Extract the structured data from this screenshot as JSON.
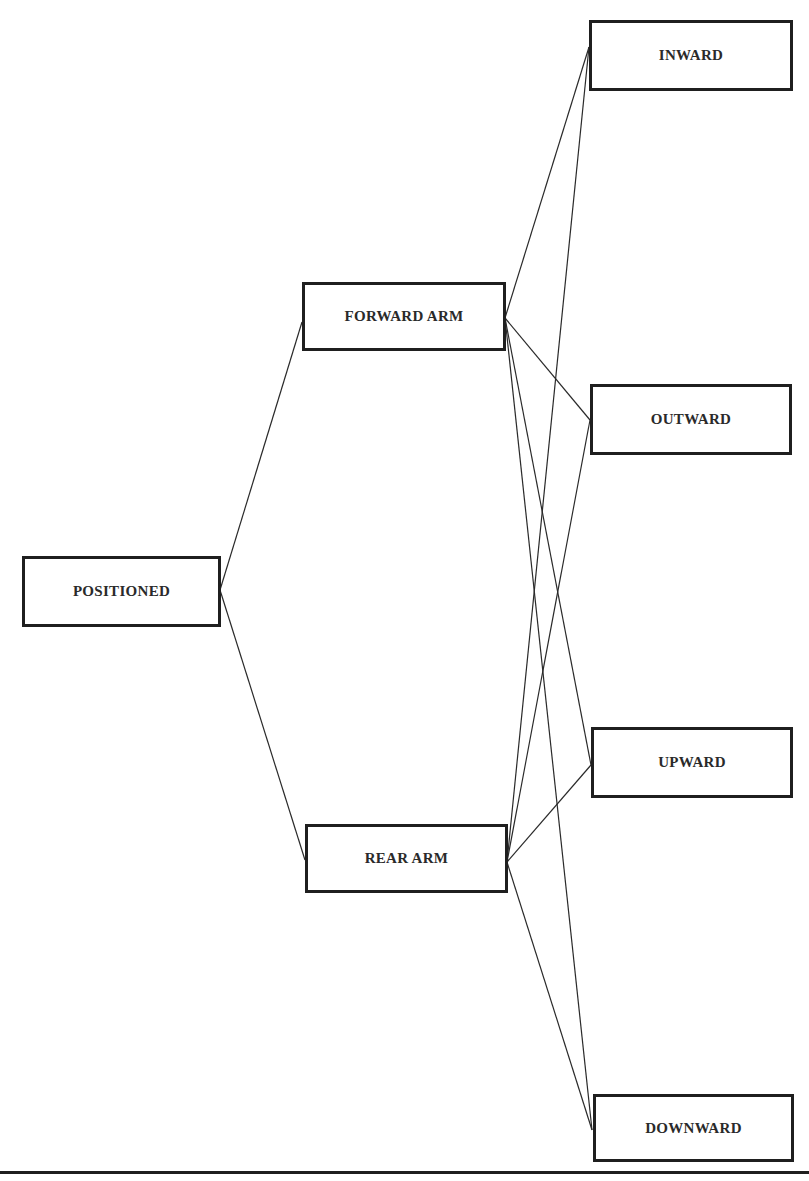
{
  "diagram": {
    "nodes": [
      {
        "id": "positioned",
        "label": "POSITIONED",
        "x": 22,
        "y": 556,
        "w": 199,
        "h": 71
      },
      {
        "id": "forward_arm",
        "label": "FORWARD ARM",
        "x": 302,
        "y": 282,
        "w": 204,
        "h": 69
      },
      {
        "id": "rear_arm",
        "label": "REAR ARM",
        "x": 305,
        "y": 824,
        "w": 203,
        "h": 69
      },
      {
        "id": "inward",
        "label": "INWARD",
        "x": 589,
        "y": 20,
        "w": 204,
        "h": 71
      },
      {
        "id": "outward",
        "label": "OUTWARD",
        "x": 590,
        "y": 384,
        "w": 202,
        "h": 71
      },
      {
        "id": "upward",
        "label": "UPWARD",
        "x": 591,
        "y": 727,
        "w": 202,
        "h": 71
      },
      {
        "id": "downward",
        "label": "DOWNWARD",
        "x": 593,
        "y": 1094,
        "w": 201,
        "h": 68
      }
    ],
    "edges": [
      {
        "from": "positioned",
        "to": "forward_arm",
        "x1": 220,
        "y1": 590,
        "x2": 302,
        "y2": 322
      },
      {
        "from": "positioned",
        "to": "rear_arm",
        "x1": 220,
        "y1": 590,
        "x2": 305,
        "y2": 860
      },
      {
        "from": "forward_arm",
        "to": "inward",
        "x1": 505,
        "y1": 318,
        "x2": 589,
        "y2": 47
      },
      {
        "from": "forward_arm",
        "to": "outward",
        "x1": 505,
        "y1": 318,
        "x2": 590,
        "y2": 420
      },
      {
        "from": "forward_arm",
        "to": "upward",
        "x1": 505,
        "y1": 318,
        "x2": 591,
        "y2": 765
      },
      {
        "from": "forward_arm",
        "to": "downward",
        "x1": 505,
        "y1": 318,
        "x2": 592,
        "y2": 1130
      },
      {
        "from": "rear_arm",
        "to": "inward",
        "x1": 507,
        "y1": 862,
        "x2": 589,
        "y2": 47
      },
      {
        "from": "rear_arm",
        "to": "outward",
        "x1": 507,
        "y1": 862,
        "x2": 590,
        "y2": 420
      },
      {
        "from": "rear_arm",
        "to": "upward",
        "x1": 507,
        "y1": 862,
        "x2": 591,
        "y2": 765
      },
      {
        "from": "rear_arm",
        "to": "downward",
        "x1": 507,
        "y1": 862,
        "x2": 592,
        "y2": 1130
      }
    ],
    "line_color": "#2a2a2a",
    "border_color": "#1f1f1f"
  }
}
